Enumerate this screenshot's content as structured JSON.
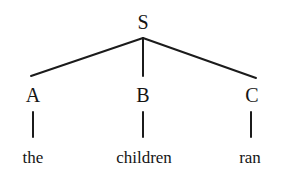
{
  "figure": {
    "width": 290,
    "height": 183,
    "background_color": "#ffffff",
    "line_color": "#1b1b1b",
    "text_color": "#151515"
  },
  "tree": {
    "root": {
      "id": "root",
      "label": "S",
      "x": 143,
      "y": 22
    },
    "branch_apex": {
      "x": 143,
      "y": 38
    },
    "nonterminals": [
      {
        "id": "a",
        "label": "A",
        "x": 33,
        "y": 95,
        "edge_end_x": 31,
        "edge_end_y": 76
      },
      {
        "id": "b",
        "label": "B",
        "x": 143,
        "y": 95,
        "edge_end_x": 143,
        "edge_end_y": 76
      },
      {
        "id": "c",
        "label": "C",
        "x": 252,
        "y": 95,
        "edge_end_x": 256,
        "edge_end_y": 78
      }
    ],
    "terminals": [
      {
        "id": "the",
        "label": "the",
        "x": 33,
        "y": 157,
        "stem_x": 33,
        "stem_top": 112,
        "stem_bottom": 137
      },
      {
        "id": "children",
        "label": "children",
        "x": 144,
        "y": 157,
        "stem_x": 143,
        "stem_top": 112,
        "stem_bottom": 137
      },
      {
        "id": "ran",
        "label": "ran",
        "x": 250,
        "y": 157,
        "stem_x": 251,
        "stem_top": 112,
        "stem_bottom": 137
      }
    ]
  }
}
